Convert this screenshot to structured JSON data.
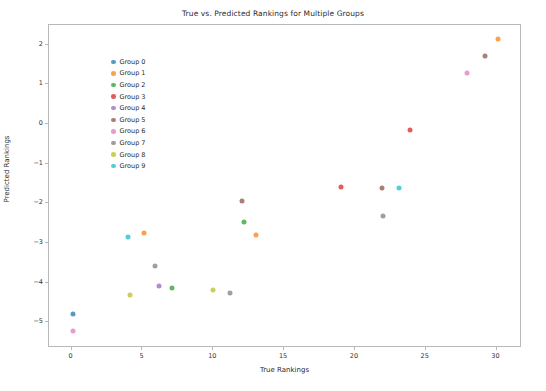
{
  "chart_data": {
    "type": "scatter",
    "title": "True vs. Predicted Rankings for Multiple Groups",
    "xlabel": "True Rankings",
    "ylabel": "Predicted Rankings",
    "xlim": [
      -1.6,
      31.8
    ],
    "ylim": [
      -5.65,
      2.5
    ],
    "xticks": [
      0,
      5,
      10,
      15,
      20,
      25,
      30
    ],
    "yticks": [
      2,
      1,
      0,
      -1,
      -2,
      -3,
      -4,
      -5
    ],
    "grid": false,
    "legend_position": "upper left",
    "marker_size": 5,
    "marker_alpha": 0.75,
    "series": [
      {
        "name": "Group 0",
        "color": "#1f77b4",
        "points": [
          [
            0.1,
            -4.78
          ]
        ]
      },
      {
        "name": "Group 1",
        "color": "#ff7f0e",
        "points": [
          [
            5.1,
            -2.74
          ],
          [
            13.0,
            -2.81
          ],
          [
            30.1,
            2.15
          ]
        ]
      },
      {
        "name": "Group 2",
        "color": "#2ca02c",
        "points": [
          [
            7.1,
            -4.14
          ],
          [
            12.2,
            -2.48
          ]
        ]
      },
      {
        "name": "Group 3",
        "color": "#d62728",
        "points": [
          [
            19.0,
            -1.6
          ],
          [
            23.9,
            -0.16
          ]
        ]
      },
      {
        "name": "Group 4",
        "color": "#9467bd",
        "points": [
          [
            6.2,
            -4.08
          ]
        ]
      },
      {
        "name": "Group 5",
        "color": "#8c564b",
        "points": [
          [
            12.0,
            -1.95
          ],
          [
            21.9,
            -1.62
          ],
          [
            29.2,
            1.72
          ]
        ]
      },
      {
        "name": "Group 6",
        "color": "#e377c2",
        "points": [
          [
            0.1,
            -5.22
          ],
          [
            27.9,
            1.3
          ]
        ]
      },
      {
        "name": "Group 7",
        "color": "#7f7f7f",
        "points": [
          [
            5.9,
            -3.58
          ],
          [
            11.2,
            -4.26
          ],
          [
            22.0,
            -2.33
          ]
        ]
      },
      {
        "name": "Group 8",
        "color": "#bcbd22",
        "points": [
          [
            4.1,
            -4.31
          ],
          [
            10.0,
            -4.18
          ]
        ]
      },
      {
        "name": "Group 9",
        "color": "#17becf",
        "points": [
          [
            4.0,
            -2.86
          ],
          [
            23.1,
            -1.62
          ]
        ]
      }
    ]
  },
  "legend": {
    "entries": [
      {
        "label": "Group 0"
      },
      {
        "label": "Group 1"
      },
      {
        "label": "Group 2"
      },
      {
        "label": "Group 3"
      },
      {
        "label": "Group 4"
      },
      {
        "label": "Group 5"
      },
      {
        "label": "Group 6"
      },
      {
        "label": "Group 7"
      },
      {
        "label": "Group 8"
      },
      {
        "label": "Group 9"
      }
    ]
  }
}
